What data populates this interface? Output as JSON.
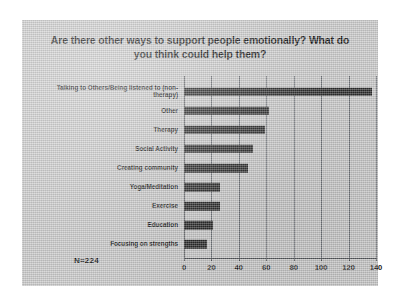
{
  "slide": {
    "title": "Are there other ways to support people emotionally? What do you think could help them?",
    "title_line1": "Are there other ways to support people emotionally? What do",
    "title_line2": "you think could help them?",
    "sample_size_label": "N=224",
    "background_color": "#c8c8c8",
    "bar_color": "#2a2a2a"
  },
  "chart_data": {
    "type": "bar",
    "orientation": "horizontal",
    "title": "Are there other ways to support people emotionally? What do you think could help them?",
    "xlabel": "",
    "ylabel": "",
    "categories": [
      "Talking to Others/Being listened to (non-therapy)",
      "Other",
      "Therapy",
      "Social Activity",
      "Creating community",
      "Yoga/Meditation",
      "Exercise",
      "Education",
      "Focusing on strengths"
    ],
    "values": [
      137,
      62,
      59,
      50,
      47,
      26,
      26,
      21,
      17
    ],
    "xlim": [
      0,
      140
    ],
    "xticks": [
      0,
      20,
      40,
      60,
      80,
      100,
      120,
      140
    ],
    "grid": true,
    "legend": false,
    "annotations": [
      "N=224"
    ]
  }
}
